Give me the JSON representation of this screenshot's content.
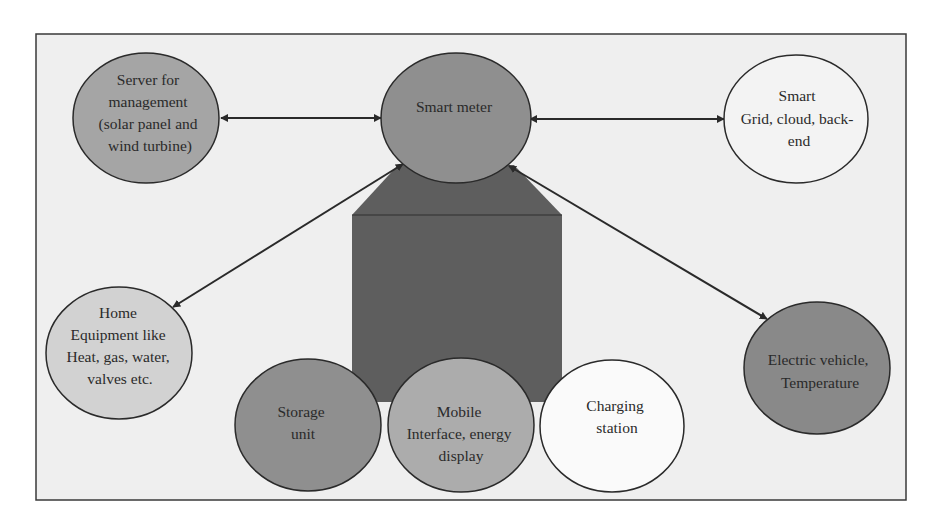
{
  "colors": {
    "frame_bg": "#efefef",
    "frame_border": "#3a3a3a",
    "house_fill": "#5e5e5e",
    "dark_node": "#8a8a8a",
    "mid_node": "#a5a5a5",
    "light_node": "#d0d0d0",
    "white_node": "#f7f7f7",
    "stroke": "#2a2a2a"
  },
  "nodes": {
    "server": {
      "lines": [
        "Server for",
        "management",
        "(solar panel and",
        "wind turbine)"
      ]
    },
    "smart_meter": {
      "lines": [
        "Smart meter"
      ]
    },
    "smart_grid": {
      "lines": [
        "Smart",
        "Grid, cloud, back-",
        "end"
      ]
    },
    "home_equipment": {
      "lines": [
        "Home",
        "Equipment like",
        "Heat, gas, water,",
        "valves etc."
      ]
    },
    "electric_vehicle": {
      "lines": [
        "Electric vehicle,",
        "Temperature"
      ]
    },
    "storage": {
      "lines": [
        "Storage",
        "unit"
      ]
    },
    "mobile": {
      "lines": [
        "Mobile",
        "Interface, energy",
        "display"
      ]
    },
    "charging": {
      "lines": [
        "Charging",
        "station"
      ]
    }
  },
  "connections": [
    {
      "from": "server",
      "to": "smart_meter",
      "type": "bidirectional"
    },
    {
      "from": "smart_meter",
      "to": "smart_grid",
      "type": "bidirectional"
    },
    {
      "from": "smart_meter",
      "to": "home_equipment",
      "type": "bidirectional"
    },
    {
      "from": "smart_meter",
      "to": "electric_vehicle",
      "type": "bidirectional"
    }
  ]
}
